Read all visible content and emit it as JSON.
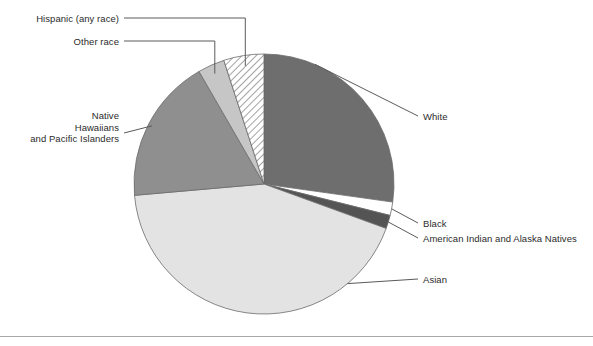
{
  "figure": {
    "width": 593,
    "height": 346,
    "background": "#ffffff",
    "rule_color": "#a8a8a8"
  },
  "chart_data": {
    "type": "pie",
    "title": "",
    "subtitle": "",
    "xlabel": "",
    "ylabel": "",
    "legend_position": "none",
    "grid": false,
    "labels_style": "leader-line callouts",
    "center": {
      "x": 264,
      "y": 184
    },
    "radius": 130,
    "start_angle_deg": 0,
    "direction": "clockwise",
    "categories": [
      "White",
      "Black",
      "American Indian and Alaska Natives",
      "Asian",
      "Native Hawaiians and Pacific Islanders",
      "Other race",
      "Hispanic (any race)"
    ],
    "values": [
      27.2,
      1.7,
      1.7,
      43.1,
      18.1,
      3.3,
      4.9
    ],
    "value_unit": "percent",
    "slices": [
      {
        "name": "White",
        "value": 27.2,
        "start_deg": 0,
        "end_deg": 98,
        "fill": "#6e6e6e",
        "pattern": "solid",
        "label": "White",
        "label_side": "right"
      },
      {
        "name": "Black",
        "value": 1.7,
        "start_deg": 98,
        "end_deg": 104,
        "fill": "#ffffff",
        "pattern": "solid",
        "label": "Black",
        "label_side": "right"
      },
      {
        "name": "American Indian and Alaska Natives",
        "value": 1.7,
        "start_deg": 104,
        "end_deg": 110,
        "fill": "#545454",
        "pattern": "solid",
        "label": "American Indian and Alaska Natives",
        "label_side": "right"
      },
      {
        "name": "Asian",
        "value": 43.1,
        "start_deg": 110,
        "end_deg": 265,
        "fill": "#e3e3e3",
        "pattern": "solid",
        "label": "Asian",
        "label_side": "right"
      },
      {
        "name": "Native Hawaiians and Pacific Islanders",
        "value": 18.1,
        "start_deg": 265,
        "end_deg": 330,
        "fill": "#8f8f8f",
        "pattern": "solid",
        "label": "Native Hawaiians and Pacific Islanders",
        "label_side": "left"
      },
      {
        "name": "Other race",
        "value": 3.3,
        "start_deg": 330,
        "end_deg": 342,
        "fill": "#c6c6c6",
        "pattern": "solid",
        "label": "Other race",
        "label_side": "left"
      },
      {
        "name": "Hispanic (any race)",
        "value": 4.9,
        "start_deg": 342,
        "end_deg": 360,
        "fill": "#ffffff",
        "pattern": "diagonal-hatch",
        "label": "Hispanic (any race)",
        "label_side": "left"
      }
    ]
  },
  "callouts": {
    "hispanic": {
      "text": "Hispanic (any race)",
      "x": 14,
      "y": 13,
      "align": "right",
      "width": 105
    },
    "other_race": {
      "text": "Other race",
      "x": 14,
      "y": 36,
      "align": "right",
      "width": 105
    },
    "native_hawaiians": {
      "line1": "Native",
      "line2": "Hawaiians",
      "line3": "and Pacific Islanders",
      "x": 10,
      "y": 110,
      "align": "right",
      "width": 109
    },
    "white": {
      "text": "White",
      "x": 423,
      "y": 111,
      "align": "left"
    },
    "black": {
      "text": "Black",
      "x": 423,
      "y": 218,
      "align": "left"
    },
    "american_indian": {
      "text": "American Indian and Alaska Natives",
      "x": 423,
      "y": 233,
      "align": "left"
    },
    "asian": {
      "text": "Asian",
      "x": 423,
      "y": 274,
      "align": "left"
    }
  },
  "colors": {
    "white_slice": "#6e6e6e",
    "black_slice": "#ffffff",
    "american_indian_slice": "#545454",
    "asian_slice": "#e3e3e3",
    "native_hawaiians_slice": "#8f8f8f",
    "other_race_slice": "#c6c6c6",
    "hispanic_slice_hatch": "#555555",
    "outline": "#6b6b6b",
    "leader_line": "#5a5a5a",
    "text": "#2b2b2b"
  }
}
